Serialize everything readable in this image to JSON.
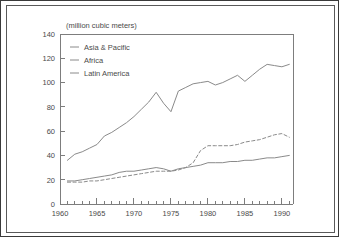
{
  "chart_data": {
    "type": "line",
    "title": "",
    "subtitle": "",
    "units_label": "(million cubic meters)",
    "xlabel": "",
    "ylabel": "",
    "xlim": [
      1960,
      1991.5
    ],
    "ylim": [
      0,
      140
    ],
    "y_ticks": [
      0,
      20,
      40,
      60,
      80,
      100,
      120,
      140
    ],
    "y_tick_labels": [
      "0",
      "20",
      "40",
      "60",
      "80",
      "100",
      "120",
      "140"
    ],
    "x_ticks": [
      1960,
      1965,
      1970,
      1975,
      1980,
      1985,
      1990
    ],
    "x_tick_labels": [
      "1960",
      "1965",
      "1970",
      "1975",
      "1980",
      "1985",
      "1990"
    ],
    "x_minor_tick_step": 1,
    "grid": false,
    "legend_position": "top-left-inside",
    "x": [
      1961,
      1962,
      1963,
      1964,
      1965,
      1966,
      1967,
      1968,
      1969,
      1970,
      1971,
      1972,
      1973,
      1974,
      1975,
      1976,
      1977,
      1978,
      1979,
      1980,
      1981,
      1982,
      1983,
      1984,
      1985,
      1986,
      1987,
      1988,
      1989,
      1990,
      1991
    ],
    "series": [
      {
        "name": "Asia & Pacific",
        "style": "solid",
        "color": "#8a8a8a",
        "values": [
          36,
          41,
          43,
          46,
          49,
          56,
          59,
          63,
          67,
          72,
          78,
          84,
          92,
          83,
          76,
          93,
          96,
          99,
          100,
          101,
          98,
          100,
          103,
          106,
          101,
          106,
          111,
          115,
          114,
          113,
          115
        ]
      },
      {
        "name": "Africa",
        "style": "solid",
        "color": "#8a8a8a",
        "values": [
          19,
          19,
          20,
          21,
          22,
          23,
          24,
          26,
          27,
          27,
          28,
          29,
          30,
          29,
          27,
          29,
          30,
          31,
          32,
          34,
          34,
          34,
          35,
          35,
          36,
          36,
          37,
          38,
          38,
          39,
          40
        ]
      },
      {
        "name": "Latin America",
        "style": "dashed",
        "color": "#8a8a8a",
        "values": [
          18,
          18,
          18,
          19,
          19,
          20,
          21,
          22,
          23,
          24,
          25,
          26,
          27,
          27,
          27,
          28,
          30,
          34,
          44,
          48,
          48,
          48,
          48,
          49,
          51,
          52,
          53,
          55,
          57,
          58,
          55
        ]
      }
    ]
  },
  "legend": {
    "entries": [
      {
        "label": "Asia & Pacific"
      },
      {
        "label": "Africa"
      },
      {
        "label": "Latin America"
      }
    ]
  }
}
